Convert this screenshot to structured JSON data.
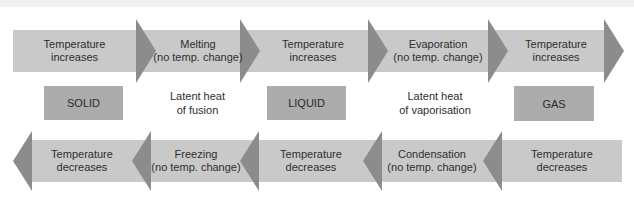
{
  "diagram": {
    "colors": {
      "band": "#c9c9c9",
      "arrowhead": "#8c8c8c",
      "state_box": "#acacac",
      "text": "#2e2e2e"
    },
    "top_row": {
      "direction": "right",
      "segments": [
        {
          "line1": "Temperature",
          "line2": "increases"
        },
        {
          "line1": "Melting",
          "line2": "(no temp. change)"
        },
        {
          "line1": "Temperature",
          "line2": "increases"
        },
        {
          "line1": "Evaporation",
          "line2": "(no temp. change)"
        },
        {
          "line1": "Temperature",
          "line2": "increases"
        }
      ]
    },
    "middle_row": {
      "states": [
        "SOLID",
        "LIQUID",
        "GAS"
      ],
      "latent": [
        {
          "line1": "Latent heat",
          "line2": "of fusion"
        },
        {
          "line1": "Latent heat",
          "line2": "of vaporisation"
        }
      ]
    },
    "bottom_row": {
      "direction": "left",
      "segments": [
        {
          "line1": "Temperature",
          "line2": "decreases"
        },
        {
          "line1": "Freezing",
          "line2": "(no temp. change)"
        },
        {
          "line1": "Temperature",
          "line2": "decreases"
        },
        {
          "line1": "Condensation",
          "line2": "(no temp. change)"
        },
        {
          "line1": "Temperature",
          "line2": "decreases"
        }
      ]
    }
  }
}
